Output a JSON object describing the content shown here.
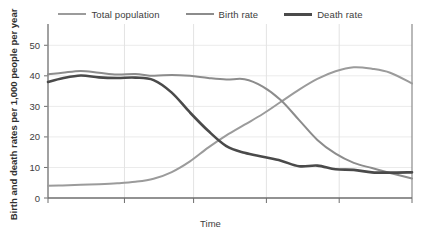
{
  "chart_data": {
    "type": "line",
    "title": "",
    "xlabel": "Time",
    "ylabel": "Birth and death rates per 1,000 people per year",
    "ylim": [
      0,
      55
    ],
    "yticks": [
      0,
      10,
      20,
      30,
      40,
      50
    ],
    "ytick_labels": [
      "0",
      "10",
      "20",
      "30",
      "40",
      "50"
    ],
    "xlim": [
      0,
      100
    ],
    "xticks": [
      0,
      21,
      40,
      60,
      80,
      100
    ],
    "xtick_labels": [
      "",
      "",
      "",
      "",
      "",
      ""
    ],
    "grid": "both-light",
    "legend_position": "top-center",
    "series": [
      {
        "name": "Total population",
        "color": "#9b9b9b",
        "width": 2.0,
        "x": [
          0,
          4,
          9,
          14,
          19,
          24,
          29,
          34,
          39,
          44,
          49,
          54,
          59,
          64,
          69,
          74,
          79,
          84,
          89,
          94,
          100
        ],
        "y": [
          4.0,
          4.1,
          4.3,
          4.5,
          4.8,
          5.3,
          6.3,
          8.5,
          12.0,
          16.5,
          20.5,
          24.0,
          27.5,
          31.5,
          35.5,
          39.0,
          41.5,
          42.8,
          42.3,
          41.0,
          37.5
        ]
      },
      {
        "name": "Birth rate",
        "color": "#8c8c8c",
        "width": 2.0,
        "x": [
          0,
          4,
          9,
          14,
          19,
          24,
          29,
          34,
          39,
          44,
          49,
          54,
          59,
          64,
          69,
          74,
          79,
          84,
          89,
          94,
          100
        ],
        "y": [
          40.5,
          41.0,
          41.6,
          41.0,
          40.4,
          40.6,
          40.0,
          40.3,
          40.0,
          39.3,
          38.8,
          38.9,
          36.5,
          32.0,
          25.5,
          19.0,
          14.5,
          11.5,
          9.8,
          8.2,
          6.4
        ]
      },
      {
        "name": "Death rate",
        "color": "#4a4a4a",
        "width": 2.6,
        "x": [
          0,
          4,
          9,
          14,
          19,
          24,
          29,
          34,
          39,
          44,
          49,
          54,
          59,
          64,
          69,
          74,
          79,
          84,
          89,
          94,
          100
        ],
        "y": [
          38.0,
          39.2,
          40.1,
          39.5,
          39.3,
          39.4,
          38.6,
          34.5,
          28.0,
          22.0,
          17.0,
          14.8,
          13.5,
          12.2,
          10.4,
          10.6,
          9.4,
          9.2,
          8.4,
          8.3,
          8.4
        ]
      }
    ]
  },
  "legend": {
    "items": [
      {
        "label": "Total population",
        "color": "#9b9b9b",
        "width": "2px"
      },
      {
        "label": "Birth rate",
        "color": "#8c8c8c",
        "width": "2px"
      },
      {
        "label": "Death rate",
        "color": "#4a4a4a",
        "width": "3px"
      }
    ]
  },
  "axes": {
    "y_axis_title": "Birth and death rates per 1,000 people per year",
    "x_axis_title": "Time"
  }
}
